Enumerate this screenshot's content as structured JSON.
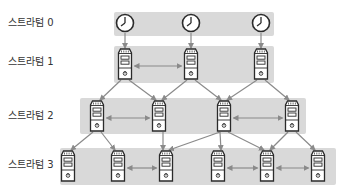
{
  "strata": [
    {
      "label": "스트라텀 0",
      "label_y": 17
    },
    {
      "label": "스트라텀 1",
      "label_y": 56
    },
    {
      "label": "스트라텀 2",
      "label_y": 110
    },
    {
      "label": "스트라텀 3",
      "label_y": 159
    }
  ],
  "colors": {
    "band": "#d9d9d9",
    "arrow": "#8a8a8a",
    "icon_stroke": "#2b2b2b",
    "icon_fill": "#ffffff",
    "text": "#333333"
  },
  "bands": [
    {
      "id": "stratum-0-band",
      "x": 114,
      "y": 12,
      "w": 160,
      "h": 24
    },
    {
      "id": "stratum-1-band",
      "x": 114,
      "y": 46,
      "w": 160,
      "h": 37
    },
    {
      "id": "stratum-2-band",
      "x": 80,
      "y": 98,
      "w": 226,
      "h": 36
    },
    {
      "id": "stratum-3-band",
      "x": 60,
      "y": 148,
      "w": 276,
      "h": 37
    }
  ],
  "clocks": [
    {
      "id": "clock-a",
      "cx": 125,
      "cy": 23
    },
    {
      "id": "clock-b",
      "cx": 191,
      "cy": 23
    },
    {
      "id": "clock-c",
      "cx": 261,
      "cy": 23
    }
  ],
  "servers": [
    {
      "id": "s1a",
      "cx": 125,
      "top": 49
    },
    {
      "id": "s1b",
      "cx": 191,
      "top": 49
    },
    {
      "id": "s1c",
      "cx": 261,
      "top": 49
    },
    {
      "id": "s2a",
      "cx": 97,
      "top": 101
    },
    {
      "id": "s2b",
      "cx": 159,
      "top": 101
    },
    {
      "id": "s2c",
      "cx": 224,
      "top": 101
    },
    {
      "id": "s2d",
      "cx": 292,
      "top": 101
    },
    {
      "id": "s3a",
      "cx": 68,
      "top": 151
    },
    {
      "id": "s3b",
      "cx": 118,
      "top": 151
    },
    {
      "id": "s3c",
      "cx": 166,
      "top": 151
    },
    {
      "id": "s3d",
      "cx": 218,
      "top": 151
    },
    {
      "id": "s3e",
      "cx": 267,
      "top": 151
    },
    {
      "id": "s3f",
      "cx": 318,
      "top": 151
    }
  ],
  "edges": [
    {
      "from": "clock-a",
      "to": "s1a",
      "type": "sync"
    },
    {
      "from": "clock-b",
      "to": "s1b",
      "type": "sync"
    },
    {
      "from": "clock-c",
      "to": "s1c",
      "type": "sync"
    },
    {
      "from": "s1a",
      "to": "s2a",
      "type": "sync"
    },
    {
      "from": "s1a",
      "to": "s2b",
      "type": "sync"
    },
    {
      "from": "s1b",
      "to": "s2b",
      "type": "sync"
    },
    {
      "from": "s1b",
      "to": "s2c",
      "type": "sync"
    },
    {
      "from": "s1c",
      "to": "s2c",
      "type": "sync"
    },
    {
      "from": "s1c",
      "to": "s2d",
      "type": "sync"
    },
    {
      "from": "s2a",
      "to": "s3a",
      "type": "sync"
    },
    {
      "from": "s2a",
      "to": "s3b",
      "type": "sync"
    },
    {
      "from": "s2b",
      "to": "s3c",
      "type": "sync"
    },
    {
      "from": "s2c",
      "to": "s3c",
      "type": "sync"
    },
    {
      "from": "s2c",
      "to": "s3d",
      "type": "sync"
    },
    {
      "from": "s2c",
      "to": "s3e",
      "type": "sync"
    },
    {
      "from": "s2d",
      "to": "s3e",
      "type": "sync"
    },
    {
      "from": "s2d",
      "to": "s3f",
      "type": "sync"
    },
    {
      "from": "s1a",
      "to": "s1b",
      "type": "peer"
    },
    {
      "from": "s2a",
      "to": "s2b",
      "type": "peer"
    },
    {
      "from": "s2c",
      "to": "s2d",
      "type": "peer"
    },
    {
      "from": "s3b",
      "to": "s3c",
      "type": "peer"
    },
    {
      "from": "s3d",
      "to": "s3e",
      "type": "peer"
    },
    {
      "from": "s3e",
      "to": "s3f",
      "type": "peer"
    }
  ]
}
